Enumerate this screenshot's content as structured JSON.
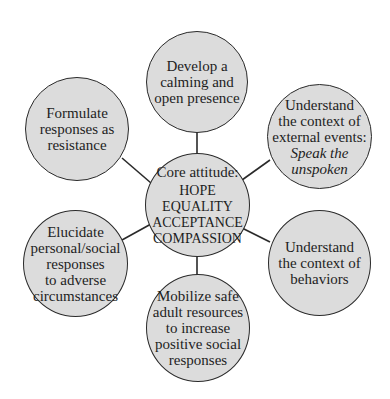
{
  "diagram": {
    "title": "",
    "style": {
      "node_fill": "#dcdcdc",
      "node_stroke": "#2a2a2a",
      "link_stroke": "#2a2a2a",
      "background": "#ffffff"
    },
    "core": {
      "title": "Core attitude:",
      "values": [
        "HOPE",
        "EQUALITY",
        "ACCEPTANCE",
        "COMPASSION"
      ]
    },
    "nodes": [
      {
        "id": "top",
        "lines": [
          "Develop a",
          "calming and",
          "open presence"
        ]
      },
      {
        "id": "top-right",
        "lines": [
          "Understand",
          "the context of",
          "external events:"
        ],
        "italic_lines": [
          "Speak the",
          "unspoken"
        ]
      },
      {
        "id": "bottom-right",
        "lines": [
          "Understand",
          "the context of",
          "behaviors"
        ]
      },
      {
        "id": "bottom",
        "lines": [
          "Mobilize safe",
          "adult resources",
          "to increase",
          "positive social",
          "responses"
        ]
      },
      {
        "id": "bottom-left",
        "lines": [
          "Elucidate",
          "personal/social",
          "responses",
          "to adverse",
          "circumstances"
        ]
      },
      {
        "id": "top-left",
        "lines": [
          "Formulate",
          "responses as",
          "resistance"
        ]
      }
    ]
  }
}
